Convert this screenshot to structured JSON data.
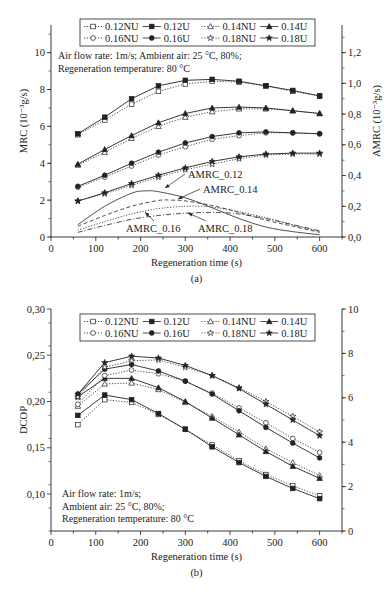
{
  "chart_data": [
    {
      "id": "a",
      "type": "line",
      "caption": "(a)",
      "xlabel": "Regeneration time (s)",
      "ylabel": "MRC (10⁻³g/s)",
      "y2label": "AMRC (10⁻³g/s)",
      "xlim": [
        0,
        650
      ],
      "ylim": [
        0,
        11.5
      ],
      "y2lim": [
        0,
        1.38
      ],
      "xticks": [
        0,
        100,
        200,
        300,
        400,
        500,
        600
      ],
      "yticks": [
        0,
        2,
        4,
        6,
        8,
        10
      ],
      "y2ticks": [
        "0,0",
        "0,2",
        "0,4",
        "0,6",
        "0,8",
        "1,0",
        "1,2"
      ],
      "y2tick_values": [
        0,
        0.2,
        0.4,
        0.6,
        0.8,
        1.0,
        1.2
      ],
      "annotation_lines": [
        "Air flow rate: 1m/s; Ambient air: 25 °C, 80%;",
        "Regeneration temperature: 80 °C"
      ],
      "x": [
        60,
        120,
        180,
        240,
        300,
        360,
        420,
        480,
        540,
        600
      ],
      "series": [
        {
          "name": "0.12NU",
          "marker": "square-open",
          "style": "dotted",
          "values": [
            5.55,
            6.35,
            7.2,
            7.9,
            8.3,
            8.45,
            8.4,
            8.2,
            7.9,
            7.65
          ]
        },
        {
          "name": "0.12U",
          "marker": "square-filled",
          "style": "solid",
          "values": [
            5.6,
            6.5,
            7.5,
            8.2,
            8.5,
            8.55,
            8.45,
            8.2,
            7.95,
            7.65
          ]
        },
        {
          "name": "0.14NU",
          "marker": "triangle-open",
          "style": "dotted",
          "values": [
            3.9,
            4.6,
            5.35,
            6.0,
            6.5,
            6.8,
            6.95,
            6.95,
            6.85,
            6.7
          ]
        },
        {
          "name": "0.14U",
          "marker": "triangle-filled",
          "style": "solid",
          "values": [
            3.95,
            4.75,
            5.5,
            6.2,
            6.7,
            7.0,
            7.05,
            7.0,
            6.85,
            6.7
          ]
        },
        {
          "name": "0.16NU",
          "marker": "circle-open",
          "style": "dotted",
          "values": [
            2.7,
            3.25,
            3.85,
            4.45,
            4.9,
            5.3,
            5.5,
            5.65,
            5.65,
            5.6
          ]
        },
        {
          "name": "0.16U",
          "marker": "circle-filled",
          "style": "solid",
          "values": [
            2.75,
            3.35,
            4.0,
            4.6,
            5.1,
            5.45,
            5.65,
            5.7,
            5.65,
            5.6
          ]
        },
        {
          "name": "0.18NU",
          "marker": "star-open",
          "style": "dotted",
          "values": [
            1.95,
            2.35,
            2.8,
            3.25,
            3.65,
            3.95,
            4.25,
            4.45,
            4.5,
            4.5
          ]
        },
        {
          "name": "0.18U",
          "marker": "star-filled",
          "style": "solid",
          "values": [
            1.95,
            2.4,
            2.9,
            3.35,
            3.75,
            4.1,
            4.35,
            4.5,
            4.55,
            4.55
          ]
        }
      ],
      "amrc_series": [
        {
          "name": "AMRC_0.12",
          "style": "solid",
          "axis": "right",
          "x": [
            60,
            120,
            180,
            210,
            240,
            300,
            360,
            420,
            480,
            540,
            600
          ],
          "values": [
            0.08,
            0.2,
            0.285,
            0.3,
            0.295,
            0.255,
            0.19,
            0.12,
            0.065,
            0.035,
            0.015
          ]
        },
        {
          "name": "AMRC_0.14",
          "style": "dashed",
          "axis": "right",
          "x": [
            60,
            120,
            180,
            240,
            270,
            300,
            360,
            420,
            480,
            540,
            600
          ],
          "values": [
            0.07,
            0.14,
            0.2,
            0.238,
            0.24,
            0.235,
            0.205,
            0.16,
            0.11,
            0.07,
            0.03
          ]
        },
        {
          "name": "AMRC_0.16",
          "style": "dotted",
          "axis": "right",
          "x": [
            60,
            120,
            180,
            240,
            300,
            330,
            360,
            420,
            480,
            540,
            600
          ],
          "values": [
            0.045,
            0.1,
            0.15,
            0.185,
            0.2,
            0.2,
            0.195,
            0.165,
            0.125,
            0.08,
            0.035
          ]
        },
        {
          "name": "AMRC_0.18",
          "style": "dash-dot",
          "axis": "right",
          "x": [
            60,
            120,
            180,
            240,
            300,
            360,
            390,
            420,
            480,
            540,
            600
          ],
          "values": [
            0.03,
            0.075,
            0.115,
            0.14,
            0.155,
            0.16,
            0.158,
            0.15,
            0.12,
            0.08,
            0.04
          ]
        }
      ],
      "amrc_labels": [
        {
          "text": "AMRC_0.12",
          "x": 190,
          "y": 0.35,
          "arrow_to": [
            0.61,
            0.31
          ]
        },
        {
          "text": "AMRC_0.14",
          "x": 225,
          "y": 0.27,
          "arrow_to": [
            290,
            0.235
          ]
        },
        {
          "text": "AMRC_0.16",
          "x": 170,
          "y": 0.02,
          "arrow_to": [
            205,
            0.14
          ]
        },
        {
          "text": "AMRC_0.18",
          "x": 330,
          "y": 0.02,
          "arrow_to": [
            310,
            0.12
          ]
        }
      ],
      "legend": {
        "position": "top-center",
        "columns": 4,
        "entries": [
          "0.12NU",
          "0.12U",
          "0.14NU",
          "0.14U",
          "0.16NU",
          "0.16U",
          "0.18NU",
          "0.18U"
        ]
      },
      "grid": false
    },
    {
      "id": "b",
      "type": "line",
      "caption": "(b)",
      "xlabel": "Regeneration time (s)",
      "ylabel": "DCOP",
      "xlim": [
        0,
        650
      ],
      "ylim": [
        0.06,
        0.3
      ],
      "y2lim": [
        0,
        10
      ],
      "xticks": [
        0,
        100,
        200,
        300,
        400,
        500,
        600
      ],
      "yticks": [
        "0,10",
        "0,15",
        "0,20",
        "0,25",
        "0,30"
      ],
      "ytick_values": [
        0.1,
        0.15,
        0.2,
        0.25,
        0.3
      ],
      "y2ticks": [
        0,
        2,
        4,
        6,
        8,
        10
      ],
      "annotation_lines": [
        "Air flow rate: 1m/s;",
        "Ambient air: 25 °C, 80%;",
        "Regeneration temperature: 80 °C"
      ],
      "x": [
        60,
        120,
        180,
        240,
        300,
        360,
        420,
        480,
        540,
        600
      ],
      "series": [
        {
          "name": "0.12NU",
          "marker": "square-open",
          "style": "dotted",
          "values": [
            0.175,
            0.202,
            0.199,
            0.186,
            0.17,
            0.153,
            0.136,
            0.121,
            0.109,
            0.098
          ]
        },
        {
          "name": "0.12U",
          "marker": "square-filled",
          "style": "solid",
          "values": [
            0.185,
            0.207,
            0.202,
            0.187,
            0.17,
            0.151,
            0.134,
            0.119,
            0.106,
            0.095
          ]
        },
        {
          "name": "0.14NU",
          "marker": "triangle-open",
          "style": "dotted",
          "values": [
            0.195,
            0.219,
            0.22,
            0.213,
            0.199,
            0.184,
            0.167,
            0.149,
            0.134,
            0.12
          ]
        },
        {
          "name": "0.14U",
          "marker": "triangle-filled",
          "style": "solid",
          "values": [
            0.205,
            0.225,
            0.225,
            0.215,
            0.2,
            0.182,
            0.164,
            0.146,
            0.13,
            0.117
          ]
        },
        {
          "name": "0.16NU",
          "marker": "circle-open",
          "style": "dotted",
          "values": [
            0.197,
            0.228,
            0.234,
            0.23,
            0.222,
            0.209,
            0.193,
            0.177,
            0.16,
            0.145
          ]
        },
        {
          "name": "0.16U",
          "marker": "circle-filled",
          "style": "solid",
          "values": [
            0.208,
            0.235,
            0.24,
            0.233,
            0.222,
            0.208,
            0.19,
            0.172,
            0.155,
            0.139
          ]
        },
        {
          "name": "0.18NU",
          "marker": "star-open",
          "style": "dotted",
          "values": [
            0.205,
            0.237,
            0.244,
            0.245,
            0.237,
            0.228,
            0.215,
            0.2,
            0.184,
            0.167
          ]
        },
        {
          "name": "0.18U",
          "marker": "star-filled",
          "style": "solid",
          "values": [
            0.208,
            0.242,
            0.249,
            0.247,
            0.239,
            0.228,
            0.214,
            0.197,
            0.18,
            0.163
          ]
        }
      ],
      "legend": {
        "position": "top-center",
        "columns": 4,
        "entries": [
          "0.12NU",
          "0.12U",
          "0.14NU",
          "0.14U",
          "0.16NU",
          "0.16U",
          "0.18NU",
          "0.18U"
        ]
      },
      "grid": false
    }
  ],
  "colors": {
    "ink": "#222222",
    "background": "#ffffff"
  }
}
